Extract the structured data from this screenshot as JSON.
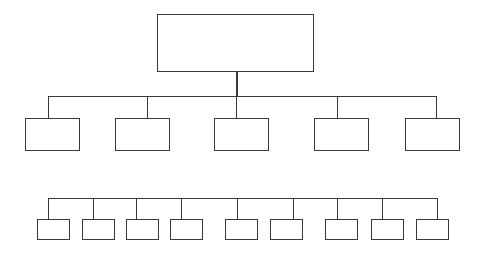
{
  "diagram": {
    "type": "org-chart",
    "line_color": "#3a3a3a",
    "background": "#ffffff",
    "root": {
      "label": "",
      "box": [
        157,
        14,
        157,
        58
      ]
    },
    "level1": {
      "bus_y": 96,
      "bus_x": [
        48,
        436
      ],
      "drop_from": 96,
      "children": [
        {
          "label": "",
          "box": [
            25,
            118,
            55,
            33
          ],
          "connector_x": 48
        },
        {
          "label": "",
          "box": [
            115,
            118,
            55,
            33
          ],
          "connector_x": 147
        },
        {
          "label": "",
          "box": [
            214,
            118,
            55,
            33
          ],
          "connector_x": 236
        },
        {
          "label": "",
          "box": [
            314,
            118,
            55,
            33
          ],
          "connector_x": 337
        },
        {
          "label": "",
          "box": [
            405,
            118,
            55,
            33
          ],
          "connector_x": 436
        }
      ]
    },
    "level2": {
      "bus_y": 198,
      "bus_x": [
        48,
        437
      ],
      "children": [
        {
          "label": "",
          "box": [
            37,
            219,
            33,
            21
          ],
          "connector_x": 48
        },
        {
          "label": "",
          "box": [
            82,
            219,
            33,
            21
          ],
          "connector_x": 93
        },
        {
          "label": "",
          "box": [
            126,
            219,
            33,
            21
          ],
          "connector_x": 136
        },
        {
          "label": "",
          "box": [
            170,
            219,
            33,
            21
          ],
          "connector_x": 181
        },
        {
          "label": "",
          "box": [
            225,
            219,
            33,
            21
          ],
          "connector_x": 237
        },
        {
          "label": "",
          "box": [
            270,
            219,
            33,
            21
          ],
          "connector_x": 293
        },
        {
          "label": "",
          "box": [
            325,
            219,
            33,
            21
          ],
          "connector_x": 337
        },
        {
          "label": "",
          "box": [
            371,
            219,
            33,
            21
          ],
          "connector_x": 382
        },
        {
          "label": "",
          "box": [
            416,
            219,
            33,
            21
          ],
          "connector_x": 437
        }
      ]
    }
  }
}
